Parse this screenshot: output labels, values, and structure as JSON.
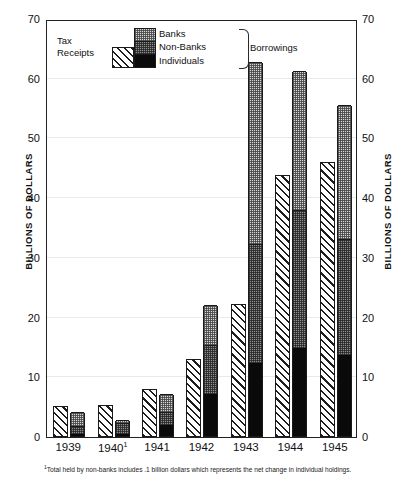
{
  "axes": {
    "ylabel_left": "BILLIONS OF DOLLARS",
    "ylabel_right": "BILLIONS OF DOLLARS",
    "ticks": [
      "0",
      "10",
      "20",
      "30",
      "40",
      "50",
      "60",
      "70"
    ]
  },
  "legend": {
    "tax_line1": "Tax",
    "tax_line2": "Receipts",
    "banks": "Banks",
    "nonbanks": "Non-Banks",
    "individuals": "Individuals",
    "group_label": "Borrowings"
  },
  "footnote": {
    "marker": "1",
    "text": "Total held by non-banks includes .1 billion dollars which represents the net change in individual holdings."
  },
  "colors": {
    "tax": "#ffffff",
    "banks": "#d7d7d7",
    "nonbanks": "#8f8f8f",
    "individuals": "#0a0a0a",
    "outline": "#1a1a1a",
    "grid": "#e9e9e9"
  },
  "chart_data": {
    "type": "bar",
    "title": "",
    "subtitle": "",
    "xlabel": "",
    "ylabel": "BILLIONS OF DOLLARS",
    "ylim": [
      0,
      70
    ],
    "yticks": [
      0,
      10,
      20,
      30,
      40,
      50,
      60,
      70
    ],
    "grid": true,
    "legend_position": "top-left-inside",
    "grouping": "paired: Tax Receipts bar beside stacked Borrowings bar",
    "categories": [
      "1939",
      "1940",
      "1941",
      "1942",
      "1943",
      "1944",
      "1945"
    ],
    "category_labels": [
      "1939",
      "1940¹",
      "1941",
      "1942",
      "1943",
      "1944",
      "1945"
    ],
    "series": [
      {
        "name": "Tax Receipts",
        "stack": "tax",
        "values": [
          5.2,
          5.4,
          8.0,
          13.0,
          22.2,
          43.8,
          46.0
        ]
      },
      {
        "name": "Individuals",
        "stack": "borrowings",
        "values": [
          0.4,
          0.3,
          1.8,
          7.0,
          12.3,
          14.8,
          13.6
        ]
      },
      {
        "name": "Non-Banks",
        "stack": "borrowings",
        "values": [
          1.3,
          1.8,
          2.2,
          8.2,
          19.9,
          23.0,
          19.4
        ]
      },
      {
        "name": "Banks",
        "stack": "borrowings",
        "values": [
          2.3,
          0.5,
          3.0,
          6.8,
          30.5,
          23.4,
          22.5
        ]
      }
    ],
    "stack_totals": {
      "tax_receipts": [
        5.2,
        5.4,
        8.0,
        13.0,
        22.2,
        43.8,
        46.0
      ],
      "borrowings": [
        4.0,
        2.6,
        7.0,
        22.0,
        62.7,
        61.2,
        55.5
      ]
    },
    "annotations": [
      "¹ Total held by non-banks includes .1 billion dollars which represents the net change in individual holdings."
    ]
  }
}
